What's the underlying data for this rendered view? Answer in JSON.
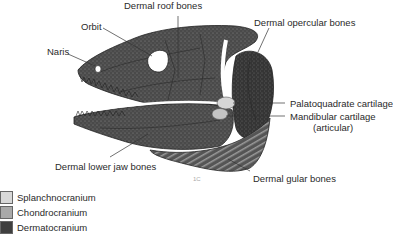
{
  "diagram": {
    "labels": {
      "dermal_roof_bones": "Dermal roof bones",
      "orbit": "Orbit",
      "naris": "Naris",
      "dermal_opercular_bones": "Dermal opercular bones",
      "palatoquadrate_cartilage": "Palatoquadrate cartilage",
      "mandibular_cartilage": "Mandibular cartilage",
      "mandibular_cartilage_sub": "(articular)",
      "dermal_lower_jaw_bones": "Dermal lower jaw bones",
      "dermal_gular_bones": "Dermal gular bones"
    },
    "corner_mark": "1C"
  },
  "legend": {
    "items": [
      {
        "label": "Splanchnocranium",
        "color": "#d8d8d8"
      },
      {
        "label": "Chondrocranium",
        "color": "#a9a9a9"
      },
      {
        "label": "Dermatocranium",
        "color": "#3f3f3f"
      }
    ]
  }
}
